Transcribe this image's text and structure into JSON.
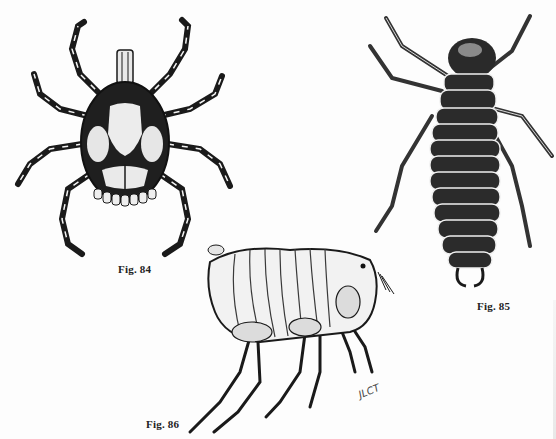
{
  "plate": {
    "background": "#fdfdfd",
    "ink": "#1a1a1a"
  },
  "figures": [
    {
      "id": "fig84",
      "label": "Fig. 84",
      "subject": "tick (dorsal view)"
    },
    {
      "id": "fig85",
      "label": "Fig. 85",
      "subject": "segmented insect larva (dorsal view)"
    },
    {
      "id": "fig86",
      "label": "Fig. 86",
      "subject": "flea (lateral view)"
    }
  ],
  "signature": "JLCT"
}
